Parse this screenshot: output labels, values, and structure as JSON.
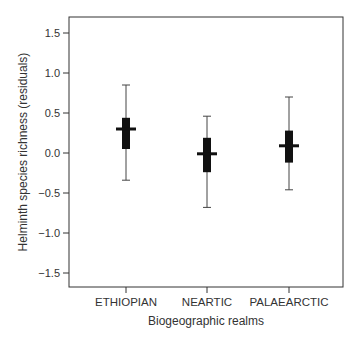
{
  "chart_data": {
    "type": "box",
    "title": "",
    "xlabel": "Biogeographic realms",
    "ylabel": "Helminth species richness (residuals)",
    "ylim": [
      -1.7,
      1.7
    ],
    "yticks": [
      1.5,
      1.0,
      0.5,
      0.0,
      -0.5,
      -1.0,
      -1.5
    ],
    "ytick_labels": [
      "1.5",
      "1.0",
      "0.5",
      "0.0",
      "−0.5",
      "−1.0",
      "−1.5"
    ],
    "categories": [
      "ETHIOPIAN",
      "NEARTIC",
      "PALAEARCTIC"
    ],
    "series": [
      {
        "name": "ETHIOPIAN",
        "whisker_high": 0.85,
        "q3": 0.44,
        "median": 0.3,
        "q1": 0.05,
        "whisker_low": -0.34
      },
      {
        "name": "NEARTIC",
        "whisker_high": 0.46,
        "q3": 0.19,
        "median": -0.01,
        "q1": -0.24,
        "whisker_low": -0.68
      },
      {
        "name": "PALAEARCTIC",
        "whisker_high": 0.7,
        "q3": 0.28,
        "median": 0.09,
        "q1": -0.12,
        "whisker_low": -0.46
      }
    ],
    "grid": false,
    "legend": "none",
    "colors": {
      "box": "#111111",
      "axis": "#333333",
      "text": "#333333"
    }
  }
}
